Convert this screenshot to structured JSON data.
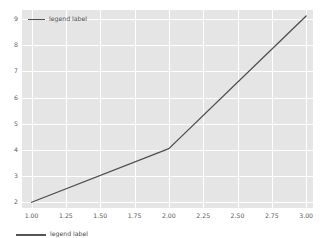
{
  "chart_data": {
    "type": "line",
    "title": "",
    "xlabel": "",
    "ylabel": "",
    "xlim": [
      0.93,
      3.05
    ],
    "ylim": [
      1.78,
      9.35
    ],
    "grid": true,
    "legend_position": "upper left",
    "xticks": [
      "1.00",
      "1.25",
      "1.50",
      "1.75",
      "2.00",
      "2.25",
      "2.50",
      "2.75",
      "3.00"
    ],
    "xtick_values": [
      1.0,
      1.25,
      1.5,
      1.75,
      2.0,
      2.25,
      2.5,
      2.75,
      3.0
    ],
    "yticks": [
      "2",
      "3",
      "4",
      "5",
      "6",
      "7",
      "8",
      "9"
    ],
    "ytick_values": [
      2,
      3,
      4,
      5,
      6,
      7,
      8,
      9
    ],
    "series": [
      {
        "name": "legend label",
        "color": "#4d4d4d",
        "linewidth": 1.3,
        "x": [
          1.0,
          2.0,
          3.0
        ],
        "values": [
          2.0,
          4.05,
          9.12
        ]
      }
    ]
  },
  "legend": {
    "entries": [
      {
        "label": "legend label",
        "color": "#4d4d4d",
        "swatch": "line-swatch"
      }
    ]
  },
  "figure_legend": {
    "entries": [
      {
        "label": "legend label",
        "color": "#555555",
        "swatch": "line-swatch"
      }
    ]
  },
  "style": {
    "figure_background": "#ffffff",
    "axes_background": "#e5e5e5",
    "gridline_color": "#ffffff",
    "tick_label_color": "#5a5a5a",
    "line_color": "#4d4d4d"
  }
}
